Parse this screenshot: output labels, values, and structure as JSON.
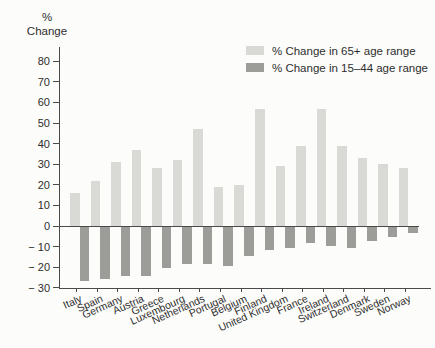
{
  "figure": {
    "y_axis_title": {
      "line1": "%",
      "line2": "Change"
    }
  },
  "chart_data": {
    "type": "bar",
    "title": "",
    "xlabel": "",
    "ylabel": "% Change",
    "ylim": [
      -30,
      80
    ],
    "ytick_step": 10,
    "ytick_labels_top_to_bottom": [
      "80",
      "70",
      "60",
      "50",
      "40",
      "30",
      "20",
      "10",
      "0",
      "− 10",
      "− 20",
      "− 30"
    ],
    "grid": false,
    "legend_position": "top-right",
    "categories": [
      "Italy",
      "Spain",
      "Germany",
      "Austria",
      "Greece",
      "Luxembourg",
      "Netherlands",
      "Portugal",
      "Belgium",
      "Finland",
      "United Kingdom",
      "France",
      "Ireland",
      "Switzerland",
      "Denmark",
      "Sweden",
      "Norway"
    ],
    "series": [
      {
        "name": "% Change in 65+ age range",
        "color": "#d9d9d6",
        "values": [
          16,
          22,
          31,
          37,
          28,
          32,
          47,
          19,
          20,
          57,
          29,
          39,
          57,
          39,
          33,
          30,
          28
        ]
      },
      {
        "name": "% Change in 15–44 age range",
        "color": "#9c9c99",
        "values": [
          -26,
          -25,
          -24,
          -24,
          -20,
          -18,
          -18,
          -19,
          -14,
          -11,
          -10,
          -8,
          -9,
          -10,
          -7,
          -5,
          -3
        ]
      }
    ]
  }
}
